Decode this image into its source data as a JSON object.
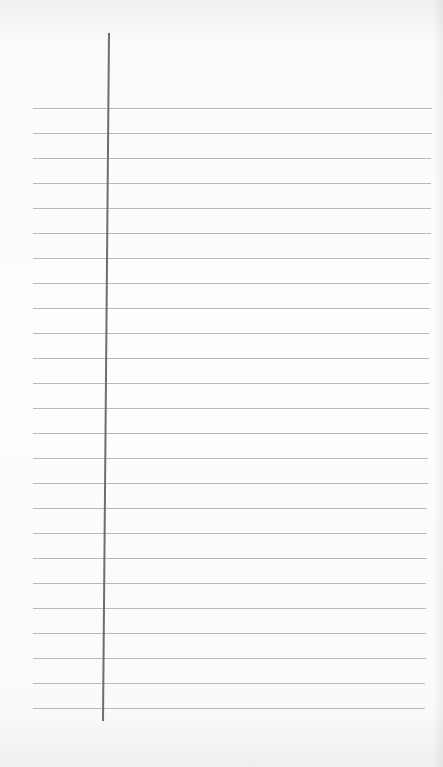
{
  "sheet": {
    "type": "ruled-paper",
    "line_count": 25,
    "first_line_y": 108,
    "line_spacing": 25,
    "line_color": "#b9b9b9",
    "margin_line_color": "#6e6e6e",
    "paper_color": "#fdfdfc",
    "text": ""
  }
}
